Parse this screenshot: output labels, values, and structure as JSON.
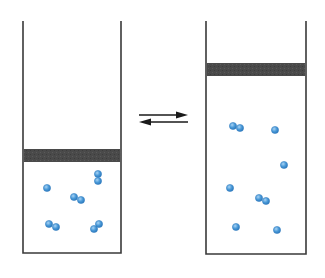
{
  "diagram": {
    "type": "piston-equilibrium",
    "width": 325,
    "height": 278,
    "colors": {
      "background": "#ffffff",
      "wall": "#3a3a3a",
      "piston": "#4a4a4a",
      "molecule": "#4a9ad8",
      "molecule_edge": "#2f7bbf",
      "molecule_highlight": "#a9d3f5",
      "arrow": "#1a1a1a"
    },
    "containers": [
      {
        "id": "left",
        "label": "compressed",
        "left": 23,
        "right": 121,
        "top": 21,
        "bottom": 253,
        "piston": {
          "top": 149,
          "bottom": 162
        },
        "molecules": [
          {
            "x": 47,
            "y": 188
          },
          {
            "x": 98,
            "y": 174
          },
          {
            "x": 98,
            "y": 181
          },
          {
            "x": 74,
            "y": 197
          },
          {
            "x": 81,
            "y": 200
          },
          {
            "x": 49,
            "y": 224
          },
          {
            "x": 56,
            "y": 227
          },
          {
            "x": 99,
            "y": 224
          },
          {
            "x": 94,
            "y": 229
          }
        ]
      },
      {
        "id": "right",
        "label": "expanded",
        "left": 206,
        "right": 306,
        "top": 21,
        "bottom": 254,
        "piston": {
          "top": 63,
          "bottom": 76
        },
        "molecules": [
          {
            "x": 233,
            "y": 126
          },
          {
            "x": 240,
            "y": 128
          },
          {
            "x": 275,
            "y": 130
          },
          {
            "x": 284,
            "y": 165
          },
          {
            "x": 230,
            "y": 188
          },
          {
            "x": 259,
            "y": 198
          },
          {
            "x": 266,
            "y": 201
          },
          {
            "x": 236,
            "y": 227
          },
          {
            "x": 277,
            "y": 230
          }
        ]
      }
    ],
    "equilibrium_arrows": [
      {
        "direction": "right",
        "x1": 139,
        "x2": 188,
        "y": 115
      },
      {
        "direction": "left",
        "x1": 139,
        "x2": 188,
        "y": 122
      }
    ],
    "molecule_radius": 3.6
  }
}
